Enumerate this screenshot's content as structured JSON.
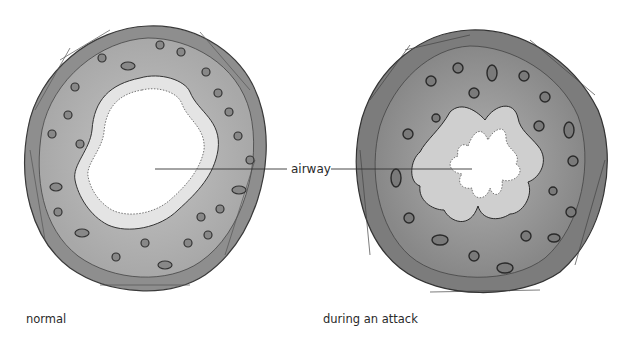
{
  "figure": {
    "title": "",
    "panels": [
      {
        "id": "normal",
        "caption": "normal",
        "state": "open airway, thin wall, smooth ring of epithelial cells"
      },
      {
        "id": "attack",
        "caption": "during an attack",
        "state": "narrowed star-shaped airway, swollen folded lining, thickened wall"
      }
    ],
    "annotation": {
      "label": "airway",
      "points_to": [
        "normal",
        "attack"
      ]
    },
    "colors": {
      "outer_wall": "#8a8a8a",
      "outer_wall_attack": "#7a7a7a",
      "tissue": "#b4b4b4",
      "tissue_attack": "#9c9c9c",
      "lumen": "#ffffff",
      "cell_outline": "#3a3a3a",
      "epithelium": "#e6e6e6"
    }
  }
}
